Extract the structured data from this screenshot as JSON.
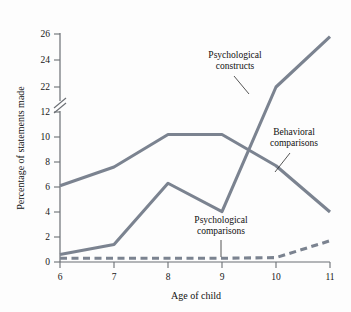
{
  "chart_data": {
    "type": "line",
    "title": "",
    "xlabel": "Age of child",
    "ylabel": "Percentage of statements made",
    "x": [
      6,
      7,
      8,
      9,
      10,
      11
    ],
    "xticklabels": [
      "6",
      "7",
      "8",
      "9",
      "10",
      "11"
    ],
    "yticklabels": [
      "0",
      "2",
      "4",
      "6",
      "8",
      "10",
      "12",
      "22",
      "24",
      "26"
    ],
    "ytickvalues": [
      0,
      2,
      4,
      6,
      8,
      10,
      12,
      22,
      24,
      26
    ],
    "ylim": [
      0,
      26
    ],
    "axis_break": {
      "present": true,
      "between": [
        12,
        22
      ],
      "symbol": "//"
    },
    "grid": false,
    "legend_position": "inline-annotations",
    "series": [
      {
        "name": "Behavioral comparisons",
        "style": "solid",
        "color": "#7b8390",
        "values": [
          6.1,
          7.6,
          10.2,
          10.2,
          7.7,
          4.0
        ]
      },
      {
        "name": "Psychological constructs",
        "style": "solid",
        "color": "#7b8390",
        "values": [
          0.6,
          1.4,
          6.3,
          12.6,
          22.0,
          25.8
        ]
      },
      {
        "name": "Psychological comparisons",
        "style": "dashed",
        "color": "#7b8390",
        "values": [
          0.3,
          0.3,
          0.3,
          0.3,
          0.35,
          1.7
        ]
      }
    ],
    "annotations": [
      {
        "id": "constructs",
        "line1": "Psychological",
        "line2": "constructs"
      },
      {
        "id": "behavioral",
        "line1": "Behavioral",
        "line2": "comparisons"
      },
      {
        "id": "comparisons",
        "line1": "Psychological",
        "line2": "comparisons"
      }
    ]
  },
  "axes": {
    "y_title": "Percentage of statements made",
    "x_title": "Age of child",
    "yticks": [
      "0",
      "2",
      "4",
      "6",
      "8",
      "10",
      "12",
      "22",
      "24",
      "26"
    ],
    "xticks": [
      "6",
      "7",
      "8",
      "9",
      "10",
      "11"
    ]
  },
  "colors": {
    "series": "#7b8390",
    "axis": "#6b6f74",
    "text": "#101010",
    "background": "#fdfdfd"
  }
}
